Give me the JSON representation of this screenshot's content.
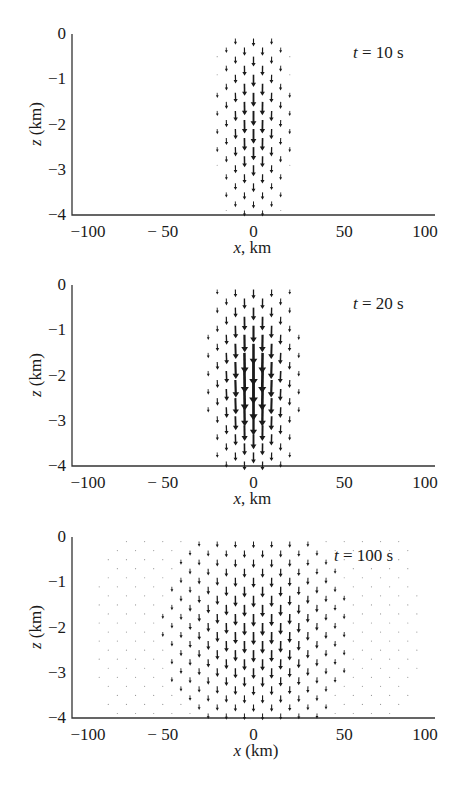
{
  "chart_data": [
    {
      "type": "quiver",
      "title": "t = 10 s",
      "time_label": {
        "var": "t",
        "text": " = 10 s"
      },
      "xlabel": {
        "var": "x",
        "text": ", km"
      },
      "ylabel": {
        "var": "z",
        "text": " (km)"
      },
      "xlim": [
        -100,
        100
      ],
      "ylim": [
        -4,
        0
      ],
      "xticks": [
        "−100",
        "− 50",
        "0",
        "50",
        "100"
      ],
      "yticks": [
        "0",
        "−1",
        "−2",
        "−3",
        "−4"
      ],
      "field": {
        "center_x_km": 0,
        "center_z_km": -1.8,
        "half_width_km": 17,
        "half_depth_km": 2.1,
        "max_speed_rel": 0.55,
        "direction": "downward"
      }
    },
    {
      "type": "quiver",
      "title": "t = 20 s",
      "time_label": {
        "var": "t",
        "text": " = 20 s"
      },
      "xlabel": {
        "var": "x",
        "text": ", km"
      },
      "ylabel": {
        "var": "z",
        "text": " (km)"
      },
      "xlim": [
        -100,
        100
      ],
      "ylim": [
        -4,
        0
      ],
      "xticks": [
        "−100",
        "− 50",
        "0",
        "50",
        "100"
      ],
      "yticks": [
        "0",
        "−1",
        "−2",
        "−3",
        "−4"
      ],
      "field": {
        "center_x_km": 0,
        "center_z_km": -2.0,
        "half_width_km": 20,
        "half_depth_km": 2.1,
        "max_speed_rel": 1.0,
        "direction": "downward"
      }
    },
    {
      "type": "quiver",
      "title": "t = 100 s",
      "time_label": {
        "var": "t",
        "text": " = 100 s"
      },
      "xlabel": {
        "var": "x",
        "text": " (km)"
      },
      "ylabel": {
        "var": "z",
        "text": " (km)"
      },
      "xlim": [
        -100,
        100
      ],
      "ylim": [
        -4,
        0
      ],
      "xticks": [
        "−100",
        "− 50",
        "0",
        "50",
        "100"
      ],
      "yticks": [
        "0",
        "−1",
        "−2",
        "−3",
        "−4"
      ],
      "field": {
        "center_x_km": 2,
        "center_z_km": -2.0,
        "half_width_km": 45,
        "half_depth_km": 2.2,
        "max_speed_rel": 0.45,
        "direction": "downward"
      }
    }
  ],
  "colors": {
    "axis": "#333333",
    "arrow": "#1a1a1a",
    "background": "#ffffff"
  }
}
